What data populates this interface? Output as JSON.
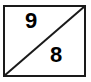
{
  "diagram": {
    "shape": "rectangle split by diagonal",
    "top_left_value": "9",
    "bottom_right_value": "8",
    "colors": {
      "stroke": "#1a1a1a",
      "text": "#000000",
      "background": "#ffffff"
    }
  }
}
